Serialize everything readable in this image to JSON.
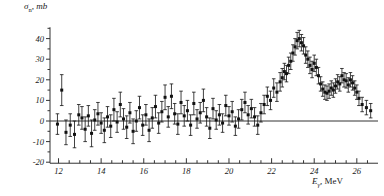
{
  "figure": {
    "background": "#ffffff",
    "ink_color": "#1a1a1a",
    "marker_color": "#111111",
    "axis_color": "#333333"
  },
  "axes": {
    "y_axis_label_sigma": "σ",
    "y_axis_label_sub": "n",
    "y_axis_label_unit": ", mb",
    "x_axis_label_e": "E",
    "x_axis_label_sub": "γ",
    "x_axis_label_unit": ", MeV"
  },
  "chart_data": {
    "type": "scatter",
    "title": "",
    "subtitle": "",
    "xlabel": "Eγ, MeV",
    "ylabel": "σn, mb",
    "xlim": [
      11.6,
      26.9
    ],
    "ylim": [
      -20,
      45
    ],
    "xticks": [
      12,
      14,
      16,
      18,
      20,
      22,
      24,
      26
    ],
    "xtick_labels": [
      "12",
      "14",
      "16",
      "18",
      "20",
      "22",
      "24",
      "26"
    ],
    "x_minor_tick_step": 0.5,
    "yticks": [
      40,
      30,
      20,
      10,
      0,
      -10,
      -20
    ],
    "ytick_labels": [
      "40",
      "30",
      "20",
      "10",
      "0",
      "-10",
      "-20"
    ],
    "grid": false,
    "legend": null,
    "zero_line": 0,
    "marker": "filled-square",
    "errorbars": "vertical-symmetric",
    "series": [
      {
        "name": "photoneutron cross section",
        "x": [
          11.95,
          12.15,
          12.35,
          12.55,
          12.75,
          12.95,
          13.1,
          13.25,
          13.4,
          13.55,
          13.7,
          13.85,
          14.0,
          14.15,
          14.3,
          14.45,
          14.6,
          14.75,
          14.9,
          15.05,
          15.2,
          15.35,
          15.5,
          15.65,
          15.8,
          15.95,
          16.1,
          16.25,
          16.4,
          16.55,
          16.7,
          16.85,
          17.0,
          17.15,
          17.3,
          17.45,
          17.6,
          17.75,
          17.9,
          18.05,
          18.2,
          18.35,
          18.5,
          18.65,
          18.8,
          18.95,
          19.1,
          19.25,
          19.4,
          19.55,
          19.7,
          19.85,
          20.0,
          20.15,
          20.3,
          20.45,
          20.6,
          20.75,
          20.9,
          21.05,
          21.2,
          21.35,
          21.5,
          21.65,
          21.8,
          21.95,
          22.1,
          22.25,
          22.4,
          22.5,
          22.6,
          22.7,
          22.8,
          22.9,
          23.0,
          23.1,
          23.2,
          23.3,
          23.4,
          23.5,
          23.6,
          23.7,
          23.8,
          23.9,
          24.0,
          24.1,
          24.2,
          24.3,
          24.4,
          24.5,
          24.6,
          24.7,
          24.8,
          24.9,
          25.0,
          25.1,
          25.2,
          25.3,
          25.4,
          25.5,
          25.6,
          25.7,
          25.8,
          25.9,
          26.0,
          26.1,
          26.25,
          26.45,
          26.65
        ],
        "y": [
          -1.5,
          15.0,
          -5.5,
          -2.0,
          -6.5,
          3.0,
          1.5,
          -4.0,
          2.5,
          -6.0,
          0.5,
          3.5,
          -1.0,
          -4.5,
          2.0,
          -2.5,
          5.5,
          -0.5,
          8.0,
          1.0,
          -3.0,
          4.0,
          -5.0,
          0.0,
          6.5,
          -2.0,
          3.0,
          -4.5,
          1.5,
          7.0,
          -1.0,
          4.5,
          11.5,
          2.0,
          12.0,
          3.5,
          -1.5,
          9.0,
          2.5,
          5.0,
          -2.0,
          8.5,
          1.0,
          4.0,
          10.0,
          2.0,
          -3.5,
          6.0,
          0.5,
          3.0,
          -1.0,
          7.5,
          2.5,
          4.5,
          -2.5,
          1.0,
          5.5,
          9.0,
          3.0,
          6.0,
          2.0,
          -2.0,
          4.0,
          8.0,
          12.0,
          10.0,
          16.0,
          14.0,
          19.0,
          21.0,
          24.0,
          23.0,
          27.0,
          29.0,
          33.0,
          36.0,
          39.0,
          40.0,
          38.0,
          36.5,
          32.0,
          30.0,
          27.0,
          25.0,
          28.0,
          26.0,
          22.0,
          18.0,
          15.5,
          14.0,
          13.5,
          14.5,
          16.0,
          15.0,
          17.0,
          19.0,
          18.0,
          22.0,
          20.0,
          19.5,
          17.5,
          20.0,
          18.5,
          16.0,
          14.0,
          11.0,
          8.0,
          6.5,
          5.0
        ],
        "yerr": [
          5.0,
          7.5,
          6.0,
          5.5,
          6.5,
          5.0,
          5.5,
          6.0,
          5.0,
          6.5,
          5.0,
          5.5,
          5.0,
          6.0,
          5.0,
          5.5,
          5.5,
          5.0,
          6.0,
          5.0,
          5.5,
          5.0,
          6.0,
          5.0,
          5.5,
          5.0,
          5.0,
          5.5,
          5.0,
          5.5,
          5.0,
          5.0,
          6.0,
          5.0,
          6.0,
          5.0,
          5.0,
          5.5,
          5.0,
          5.0,
          5.0,
          5.5,
          4.5,
          5.0,
          5.5,
          4.5,
          5.0,
          5.0,
          4.5,
          5.0,
          4.5,
          5.0,
          4.5,
          5.0,
          4.5,
          4.5,
          5.0,
          5.0,
          4.5,
          4.5,
          4.5,
          4.5,
          4.5,
          4.5,
          4.5,
          4.5,
          4.5,
          4.5,
          4.5,
          4.5,
          4.0,
          4.0,
          4.0,
          4.0,
          4.0,
          4.0,
          4.0,
          4.0,
          4.0,
          4.0,
          4.0,
          4.0,
          4.0,
          4.0,
          4.0,
          4.0,
          4.0,
          3.5,
          3.5,
          3.5,
          3.5,
          3.5,
          3.5,
          3.5,
          3.5,
          3.5,
          3.5,
          3.5,
          3.5,
          3.5,
          3.5,
          3.5,
          3.5,
          3.5,
          3.5,
          3.5,
          3.5,
          3.5,
          3.5
        ]
      }
    ]
  }
}
